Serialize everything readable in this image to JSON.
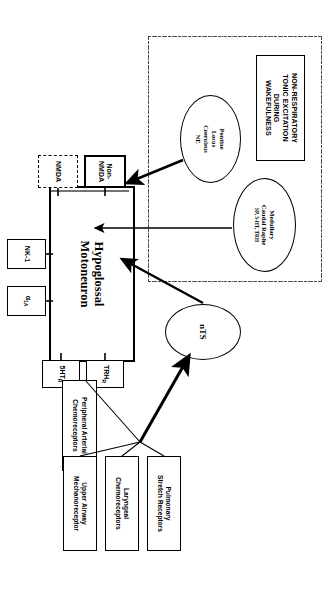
{
  "figure": {
    "title_box": {
      "line1": "NON-RESPIRATORY",
      "line2": "TONIC EXCITATION",
      "line3": "DURING",
      "line4": "WAKEFULNESS"
    },
    "sources": [
      {
        "id": "pontine-locus-coeruleus",
        "line1": "Pontine",
        "line2": "Locus",
        "line3": "Coeruleus",
        "line4": "NE"
      },
      {
        "id": "medullary-caudal-raphe",
        "line1": "Medullary",
        "line2": "Caudal Raphe",
        "line3": "SP, 5-HT, TRH"
      },
      {
        "id": "nts",
        "line1": "nTS"
      }
    ],
    "target": {
      "line1": "Hypoglossal",
      "line2": "Motoneuron"
    },
    "receptors": [
      {
        "id": "non-nmda",
        "line1": "Non-",
        "line2": "NMDA",
        "border": "solid"
      },
      {
        "id": "nmda",
        "line1": "NMDA",
        "border": "dashed"
      },
      {
        "id": "trh-r",
        "line1": "TRH",
        "sub": "R",
        "border": "solid"
      },
      {
        "id": "5ht-r",
        "line1": "5HT",
        "sub": "R",
        "border": "solid"
      },
      {
        "id": "alpha-1a",
        "line1": "α",
        "sub": "1A",
        "border": "solid"
      },
      {
        "id": "nk-1",
        "line1": "NK-1",
        "border": "solid"
      }
    ],
    "afferents": [
      {
        "id": "peripheral-arterial-chemoreceptors",
        "line1": "Peripheral  Arterial",
        "line2": "Chemoreceptors"
      },
      {
        "id": "pulmonary-stretch-receptors",
        "line1": "Pulmonary",
        "line2": "Stretch Receptors"
      },
      {
        "id": "laryngeal-chemoreceptors",
        "line1": "Laryngeal",
        "line2": "Chemoreceptors"
      },
      {
        "id": "upper-airway-mechanoreceptor",
        "line1": "Upper Airway",
        "line2": "Mechanoreceptor"
      }
    ],
    "colors": {
      "ink": "#000000",
      "paper": "#ffffff",
      "dash": "#3a3a3a"
    }
  }
}
